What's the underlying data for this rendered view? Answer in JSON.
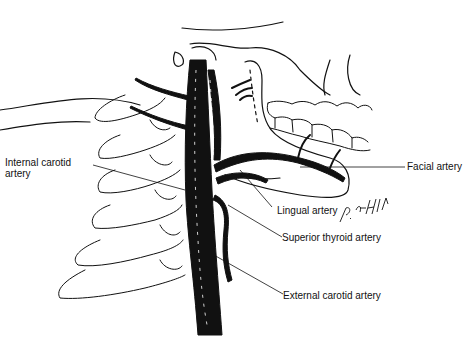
{
  "figure": {
    "signature": "P. Ashley"
  },
  "labels": {
    "internal_carotid_line1": "Internal carotid",
    "internal_carotid_line2": "artery",
    "facial": "Facial artery",
    "lingual": "Lingual artery",
    "superior_thyroid": "Superior thyroid artery",
    "external_carotid": "External carotid artery"
  },
  "colors": {
    "ink": "#111111",
    "background": "#ffffff"
  }
}
